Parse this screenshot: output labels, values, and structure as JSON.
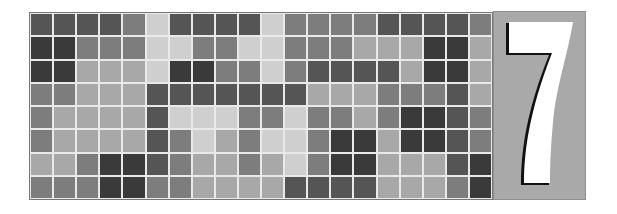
{
  "figure": {
    "numeral": "7",
    "grid": {
      "columns": 20,
      "rows": 8,
      "shade_key": {
        "VD": "#3a3a3a",
        "D": "#555555",
        "M": "#7d7d7d",
        "LM": "#a8a8a8",
        "L": "#cfcfcf"
      },
      "cells": [
        [
          "D",
          "D",
          "D",
          "D",
          "M",
          "L",
          "D",
          "D",
          "D",
          "D",
          "L",
          "M",
          "M",
          "M",
          "M",
          "D",
          "D",
          "D",
          "D",
          "M"
        ],
        [
          "VD",
          "VD",
          "M",
          "M",
          "M",
          "L",
          "L",
          "M",
          "M",
          "L",
          "L",
          "M",
          "M",
          "M",
          "LM",
          "LM",
          "LM",
          "VD",
          "VD",
          "LM"
        ],
        [
          "VD",
          "VD",
          "LM",
          "LM",
          "LM",
          "L",
          "VD",
          "VD",
          "M",
          "M",
          "L",
          "M",
          "D",
          "D",
          "D",
          "D",
          "LM",
          "VD",
          "VD",
          "LM"
        ],
        [
          "M",
          "M",
          "LM",
          "LM",
          "LM",
          "D",
          "D",
          "D",
          "D",
          "D",
          "D",
          "D",
          "LM",
          "LM",
          "LM",
          "M",
          "M",
          "M",
          "D",
          "LM"
        ],
        [
          "M",
          "LM",
          "LM",
          "LM",
          "LM",
          "D",
          "L",
          "L",
          "L",
          "M",
          "M",
          "L",
          "M",
          "M",
          "LM",
          "M",
          "VD",
          "VD",
          "D",
          "M"
        ],
        [
          "M",
          "LM",
          "LM",
          "LM",
          "LM",
          "D",
          "M",
          "L",
          "LM",
          "M",
          "L",
          "L",
          "M",
          "VD",
          "VD",
          "LM",
          "VD",
          "VD",
          "D",
          "M"
        ],
        [
          "LM",
          "LM",
          "M",
          "VD",
          "VD",
          "D",
          "M",
          "LM",
          "LM",
          "M",
          "LM",
          "L",
          "M",
          "VD",
          "VD",
          "LM",
          "LM",
          "LM",
          "D",
          "VD"
        ],
        [
          "M",
          "M",
          "M",
          "VD",
          "VD",
          "M",
          "M",
          "LM",
          "LM",
          "LM",
          "LM",
          "D",
          "D",
          "D",
          "D",
          "LM",
          "LM",
          "LM",
          "M",
          "VD"
        ]
      ]
    },
    "panel": {
      "background": "#a9a9a9",
      "numeral_fill": "#ffffff",
      "numeral_shadow": "#111111"
    }
  }
}
